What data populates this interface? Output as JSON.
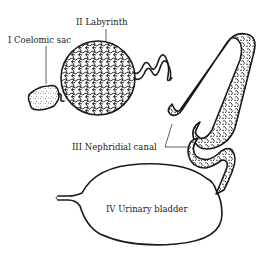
{
  "diagram": {
    "type": "anatomical line drawing",
    "labels": {
      "coelomic_sac": "I  Coelomic sac",
      "labyrinth": "II  Labyrinth",
      "nephridial_canal": "III  Nephridial canal",
      "urinary_bladder": "IV  Urinary bladder"
    },
    "colors": {
      "ink": "#1a1a1a",
      "background": "#ffffff"
    }
  }
}
